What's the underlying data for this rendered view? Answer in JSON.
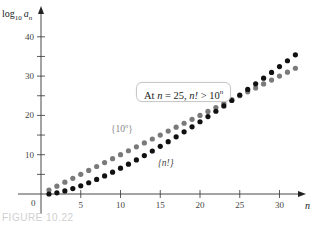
{
  "chart_data": {
    "type": "scatter",
    "title": "",
    "xlabel": "n",
    "ylabel": "log10 a_n",
    "xlim": [
      0,
      33
    ],
    "ylim": [
      0,
      47
    ],
    "x_ticks": [
      0,
      5,
      10,
      15,
      20,
      25,
      30
    ],
    "y_ticks": [
      10,
      20,
      30,
      40
    ],
    "y_minor_ticks": [
      5,
      15,
      25,
      35
    ],
    "grid": false,
    "series": [
      {
        "name": "{10^n}",
        "color": "#7a7a7a",
        "x": [
          1,
          2,
          3,
          4,
          5,
          6,
          7,
          8,
          9,
          10,
          11,
          12,
          13,
          14,
          15,
          16,
          17,
          18,
          19,
          20,
          21,
          22,
          23,
          24,
          25,
          26,
          27,
          28,
          29,
          30,
          31,
          32
        ],
        "values": [
          1,
          2,
          3,
          4,
          5,
          6,
          7,
          8,
          9,
          10,
          11,
          12,
          13,
          14,
          15,
          16,
          17,
          18,
          19,
          20,
          21,
          22,
          23,
          24,
          25,
          26,
          27,
          28,
          29,
          30,
          31,
          32
        ]
      },
      {
        "name": "{n!}",
        "color": "#111111",
        "x": [
          1,
          2,
          3,
          4,
          5,
          6,
          7,
          8,
          9,
          10,
          11,
          12,
          13,
          14,
          15,
          16,
          17,
          18,
          19,
          20,
          21,
          22,
          23,
          24,
          25,
          26,
          27,
          28,
          29,
          30,
          31,
          32
        ],
        "values": [
          0,
          0.3,
          0.78,
          1.38,
          2.08,
          2.86,
          3.7,
          4.61,
          5.56,
          6.56,
          7.6,
          8.68,
          9.79,
          10.94,
          12.12,
          13.32,
          14.55,
          15.81,
          17.09,
          18.39,
          19.71,
          21.05,
          22.41,
          23.79,
          25.19,
          26.6,
          28.04,
          29.48,
          30.94,
          32.42,
          33.91,
          35.42
        ]
      }
    ],
    "annotations": [
      {
        "text": "At n = 25, n! > 10^n",
        "boxed": true
      },
      {
        "text": "{10^n}",
        "target_series": "{10^n}"
      },
      {
        "text": "{n!}",
        "target_series": "{n!}"
      }
    ],
    "legend": "inline labels"
  },
  "labels": {
    "y_axis_title_main": "log",
    "y_axis_title_sub": "10",
    "y_axis_title_var": "a",
    "y_axis_title_var_sub": "n",
    "x_axis_title": "n",
    "origin": "0",
    "callout_prefix": "At ",
    "callout_n": "n",
    "callout_mid": " = 25, ",
    "callout_nfact": "n!",
    "callout_gt": " > 10",
    "callout_exp": "n",
    "series_10n_open": "{10",
    "series_10n_exp": "n",
    "series_10n_close": "}",
    "series_nfact": "{n!}",
    "caption": "FIGURE 10.22"
  }
}
